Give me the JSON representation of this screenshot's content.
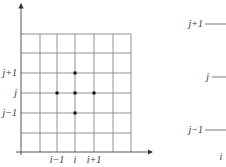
{
  "diagram": {
    "left_panel": {
      "y_labels": [
        "j+1",
        "j",
        "j−1"
      ],
      "x_labels": [
        "i−1",
        "i",
        "i+1"
      ],
      "vertical_lines_x": [
        21,
        40,
        57,
        75,
        94,
        113,
        131
      ],
      "horizontal_lines_y": [
        34,
        53,
        73,
        93,
        113,
        133
      ],
      "axis_y": 152,
      "stencil_points": [
        {
          "label": "(i, j+1)",
          "x": 75,
          "y": 73
        },
        {
          "label": "(i-1, j)",
          "x": 57,
          "y": 93
        },
        {
          "label": "(i, j)",
          "x": 75,
          "y": 93
        },
        {
          "label": "(i+1, j)",
          "x": 94,
          "y": 93
        },
        {
          "label": "(i, j-1)",
          "x": 75,
          "y": 113
        }
      ]
    },
    "right_panel": {
      "y_labels": [
        "j+1",
        "j",
        "j−1"
      ],
      "x_label": "i"
    },
    "colors": {
      "line": "#555555",
      "dot": "#111111"
    }
  }
}
